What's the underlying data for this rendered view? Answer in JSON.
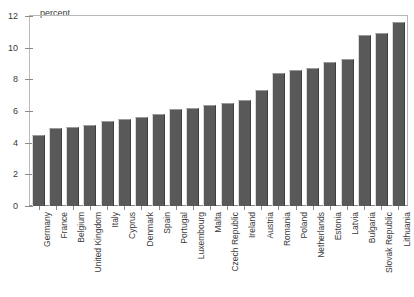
{
  "chart_data": {
    "type": "bar",
    "title": "",
    "subtitle": "",
    "unit_label": "percent",
    "xlabel": "",
    "ylabel": "percent",
    "ylim": [
      0,
      12
    ],
    "yticks": [
      0,
      2,
      4,
      6,
      8,
      10,
      12
    ],
    "grid": false,
    "legend": null,
    "orientation": "vertical",
    "bar_color": "#595959",
    "categories": [
      "Germany",
      "France",
      "Belgium",
      "United Kingdom",
      "Italy",
      "Cyprus",
      "Denmark",
      "Spain",
      "Portugal",
      "Luxembourg",
      "Malta",
      "Czech Republic",
      "Ireland",
      "Austria",
      "Romania",
      "Poland",
      "Netherlands",
      "Estonia",
      "Latvia",
      "Bulgaria",
      "Slovak Republic",
      "Lithuania"
    ],
    "values": [
      4.5,
      4.9,
      5.0,
      5.1,
      5.4,
      5.5,
      5.6,
      5.8,
      6.1,
      6.2,
      6.4,
      6.5,
      6.7,
      7.3,
      8.4,
      8.6,
      8.7,
      9.1,
      9.3,
      10.8,
      10.9,
      11.6
    ]
  }
}
